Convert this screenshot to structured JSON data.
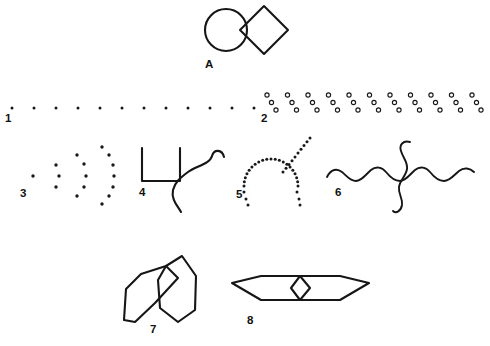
{
  "plate": {
    "title": "Figure plate with eight labelled line drawings",
    "background_color": "#ffffff",
    "ink_color": "#161616",
    "width": 490,
    "height": 346
  },
  "labels": {
    "a": "A",
    "one": "1",
    "two": "2",
    "three": "3",
    "four": "4",
    "five": "5",
    "six": "6",
    "seven": "7",
    "eight": "8"
  },
  "figures": [
    {
      "id": "A",
      "label": "A",
      "name": "circle-and-diamond",
      "description": "A circle tangent to a square rotated 45 degrees (diamond) to its right",
      "parts": [
        "circle",
        "diamond"
      ],
      "circle": {
        "cx": 226,
        "cy": 30,
        "r": 21
      },
      "diamond": {
        "cx": 264,
        "cy": 30,
        "half_diagonal": 24
      }
    },
    {
      "id": "1",
      "label": "1",
      "name": "row-of-single-dots",
      "description": "A horizontal row of evenly spaced single dots",
      "dot_count": 12,
      "dot_radius": 1.5,
      "start_x": 12,
      "spacing_x": 22,
      "baseline_y": 108
    },
    {
      "id": "2",
      "label": "2",
      "name": "row-of-diagonal-ring-triplets",
      "description": "A horizontal row of repeated triplets of small open circles descending to the right",
      "group_count": 11,
      "rings_per_group": 3,
      "ring_radius": 2.1,
      "start_x": 267,
      "spacing_x": 20.5,
      "top_y": 95,
      "step_x": 4.5,
      "step_y": 7.5
    },
    {
      "id": "3",
      "label": "3",
      "name": "nested-dotted-arcs",
      "description": "Four nested arcs of dots opening to the right, each arc larger than the last",
      "arc_dot_counts": [
        1,
        3,
        5,
        7
      ]
    },
    {
      "id": "4",
      "label": "4",
      "name": "bracket-with-wavy-line",
      "description": "An open square bracket shaped like a U with a long wavy S curve crossing its right arm",
      "parts": [
        "u-bracket",
        "wavy-s-curve"
      ]
    },
    {
      "id": "5",
      "label": "5",
      "name": "dotted-arch-with-branch",
      "description": "A dotted inverted-U arch with a dotted straight branch rising to the upper right",
      "parts": [
        "dotted-arch",
        "dotted-diagonal-branch"
      ]
    },
    {
      "id": "6",
      "label": "6",
      "name": "crossed-wavy-lines",
      "description": "A long horizontal wavy line crossed near its middle by a vertical wavy line",
      "parts": [
        "horizontal-wave",
        "vertical-wave"
      ]
    },
    {
      "id": "7",
      "label": "7",
      "name": "two-overlapping-elongated-polygons",
      "description": "Two overlapping elongated leaf-shaped hexagonal outlines, one tilted left and one upright",
      "parts": [
        "left-polygon",
        "right-polygon"
      ]
    },
    {
      "id": "8",
      "label": "8",
      "name": "flat-hexagon-with-central-diamond",
      "description": "A long flat hexagon with a small vertical diamond at its centre",
      "parts": [
        "outer-hexagon",
        "inner-diamond"
      ]
    }
  ]
}
